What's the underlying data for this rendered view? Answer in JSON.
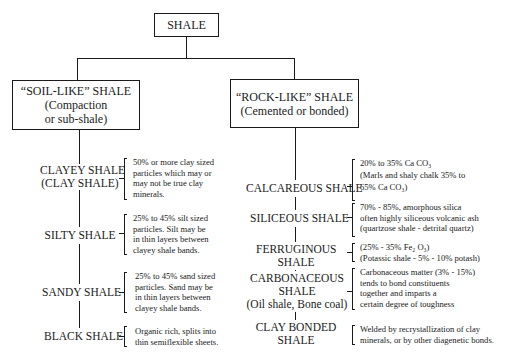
{
  "root": {
    "label": "SHALE"
  },
  "categories": [
    {
      "id": "soil-like",
      "title": "“SOIL-LIKE” SHALE",
      "subtitle_lines": [
        "(Compaction",
        "or sub-shale)"
      ],
      "types": [
        {
          "name_lines": [
            "CLAYEY SHALE",
            "(CLAY SHALE)"
          ],
          "description_lines": [
            "50% or more clay sized",
            "particles which may or",
            "may not be true clay",
            "minerals."
          ]
        },
        {
          "name_lines": [
            "SILTY SHALE"
          ],
          "description_lines": [
            "25% to 45% silt sized",
            "particles. Silt may be",
            "in thin layers between",
            "clayey shale bands."
          ]
        },
        {
          "name_lines": [
            "SANDY SHALE"
          ],
          "description_lines": [
            "25% to 45% sand sized",
            "particles. Sand may be",
            "in thin layers between",
            "clayey shale bands."
          ]
        },
        {
          "name_lines": [
            "BLACK SHALE"
          ],
          "description_lines": [
            "Organic rich, splits into",
            "thin semiflexible sheets."
          ]
        }
      ]
    },
    {
      "id": "rock-like",
      "title": "“ROCK-LIKE” SHALE",
      "subtitle_lines": [
        "(Cemented or bonded)"
      ],
      "types": [
        {
          "name_lines": [
            "CALCAREOUS SHALE"
          ],
          "description_lines": [
            "20% to 35% Ca CO₃",
            "(Marls and shaly chalk 35% to",
            "65% Ca CO₃)"
          ]
        },
        {
          "name_lines": [
            "SILICEOUS SHALE"
          ],
          "description_lines": [
            "70% - 85%, amorphous silica",
            "often highly siliceous volcanic ash",
            "(quartzose shale - detrital quartz)"
          ]
        },
        {
          "name_lines": [
            "FERRUGINOUS",
            "SHALE"
          ],
          "description_lines": [
            "(25% - 35% Fe₂ O₃)",
            "(Potassic shale - 5% - 10% potash)"
          ]
        },
        {
          "name_lines": [
            "CARBONACEOUS",
            "SHALE",
            "(Oil shale, Bone coal)"
          ],
          "description_lines": [
            "Carbonaceous matter (3% - 15%)",
            "tends to bond constituents",
            "together and imparts a",
            "certain degree of toughness"
          ]
        },
        {
          "name_lines": [
            "CLAY BONDED",
            "SHALE"
          ],
          "description_lines": [
            "Welded by recrystallization of clay",
            "minerals, or by other diagenetic bonds."
          ]
        }
      ]
    }
  ]
}
